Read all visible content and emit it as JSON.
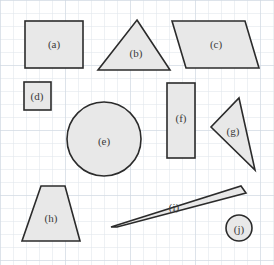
{
  "figure": {
    "canvas": {
      "width": 274,
      "height": 265
    },
    "background_color": "#ffffff",
    "grid": {
      "spacing_px": 13,
      "line_color": "#d8dee6",
      "major_line_color": "#c6cfdb",
      "visible": true
    },
    "style": {
      "shape_fill": "#e8e8e8",
      "shape_stroke": "#2b2b2b",
      "shape_stroke_width": 1.6,
      "label_color": "#3a3a3a",
      "label_font_size": 11
    }
  },
  "shapes": [
    {
      "id": "a",
      "label": "(a)",
      "kind": "rectangle",
      "label_x": 54,
      "label_y": 44,
      "geometry": {
        "x": 25,
        "y": 21,
        "width": 58,
        "height": 47
      }
    },
    {
      "id": "b",
      "label": "(b)",
      "kind": "triangle",
      "label_x": 136,
      "label_y": 53,
      "geometry": {
        "points": "137,20 170,70 98,70"
      }
    },
    {
      "id": "c",
      "label": "(c)",
      "kind": "parallelogram",
      "label_x": 216,
      "label_y": 44,
      "geometry": {
        "points": "172,21 245,21 259,68 186,68"
      }
    },
    {
      "id": "d",
      "label": "(d)",
      "kind": "square",
      "label_x": 37,
      "label_y": 96,
      "geometry": {
        "x": 24,
        "y": 82,
        "width": 27,
        "height": 28
      }
    },
    {
      "id": "e",
      "label": "(e)",
      "kind": "circle",
      "label_x": 104,
      "label_y": 141,
      "geometry": {
        "cx": 104,
        "cy": 139,
        "r": 37
      }
    },
    {
      "id": "f",
      "label": "(f)",
      "kind": "rectangle",
      "label_x": 181,
      "label_y": 118,
      "geometry": {
        "x": 167,
        "y": 83,
        "width": 28,
        "height": 75
      }
    },
    {
      "id": "g",
      "label": "(g)",
      "kind": "triangle",
      "label_x": 233,
      "label_y": 131,
      "geometry": {
        "points": "239,98 255,170 211,127"
      }
    },
    {
      "id": "h",
      "label": "(h)",
      "kind": "trapezoid",
      "label_x": 51,
      "label_y": 218,
      "geometry": {
        "points": "41,186 65,186 80,241 22,241"
      }
    },
    {
      "id": "i",
      "label": "(i)",
      "kind": "thin-parallelogram",
      "label_x": 174,
      "label_y": 207,
      "geometry": {
        "points": "241,186 245,192 117,227 111,227"
      }
    },
    {
      "id": "j",
      "label": "(j)",
      "kind": "circle",
      "label_x": 239,
      "label_y": 229,
      "geometry": {
        "cx": 239,
        "cy": 228,
        "r": 13
      }
    }
  ]
}
